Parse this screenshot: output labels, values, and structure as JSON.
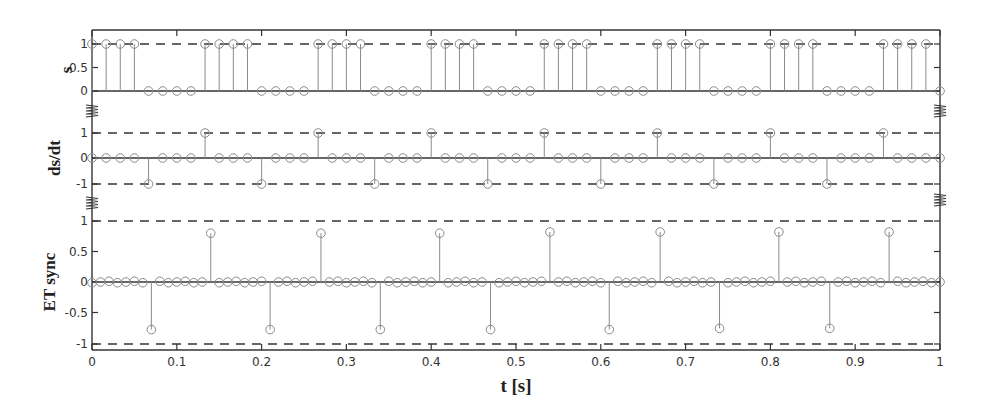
{
  "chart_data": [
    {
      "type": "stem",
      "panel": "top",
      "ylabel": "s",
      "ylim": [
        0,
        1
      ],
      "yticks": [
        "0",
        "0.5",
        "1"
      ],
      "reference_lines": [
        {
          "y": 1,
          "style": "dashed"
        },
        {
          "y": 0,
          "style": "solid"
        }
      ],
      "sample_interval": 0.016667,
      "pattern": "4 samples high (1), 4 samples low (0), period 0.1333 s",
      "x_range": [
        0,
        1
      ],
      "values_description": "square wave starting high at t=0"
    },
    {
      "type": "stem",
      "panel": "middle",
      "ylabel": "ds/dt",
      "ylim": [
        -1,
        1
      ],
      "yticks": [
        "-1",
        "0",
        "1"
      ],
      "reference_lines": [
        {
          "y": 1,
          "style": "dashed"
        },
        {
          "y": 0,
          "style": "solid"
        },
        {
          "y": -1,
          "style": "dashed"
        }
      ],
      "sample_interval": 0.016667,
      "spikes_positive_t": [
        0.133,
        0.267,
        0.4,
        0.533,
        0.667,
        0.8,
        0.933
      ],
      "spikes_negative_t": [
        0.067,
        0.2,
        0.333,
        0.467,
        0.6,
        0.733,
        0.867
      ],
      "spike_value": 1
    },
    {
      "type": "stem",
      "panel": "bottom",
      "ylabel": "ET sync",
      "ylim": [
        -1,
        1
      ],
      "yticks": [
        "-1",
        "-0.5",
        "0",
        "0.5",
        "1"
      ],
      "reference_lines": [
        {
          "y": 1,
          "style": "dashed"
        },
        {
          "y": 0,
          "style": "solid"
        },
        {
          "y": -1,
          "style": "dashed"
        }
      ],
      "sample_interval": 0.01,
      "spikes_positive_t": [
        0.14,
        0.27,
        0.41,
        0.54,
        0.67,
        0.81,
        0.94
      ],
      "spikes_positive_value": [
        0.8,
        0.8,
        0.8,
        0.82,
        0.82,
        0.82,
        0.82
      ],
      "spikes_negative_t": [
        0.07,
        0.21,
        0.34,
        0.47,
        0.61,
        0.74,
        0.87
      ],
      "spikes_negative_value": [
        -0.78,
        -0.78,
        -0.78,
        -0.78,
        -0.78,
        -0.76,
        -0.76
      ],
      "xlabel": "t [s]",
      "xticks": [
        "0",
        "0.1",
        "0.2",
        "0.3",
        "0.4",
        "0.5",
        "0.6",
        "0.7",
        "0.8",
        "0.9",
        "1"
      ],
      "xlim": [
        0,
        1
      ]
    }
  ],
  "labels": {
    "panel1_ylabel": "s",
    "panel2_ylabel": "ds/dt",
    "panel3_ylabel": "ET sync",
    "xlabel": "t [s]"
  },
  "colors": {
    "axis": "#333333",
    "stem": "#8a8a8a",
    "marker": "#8a8a8a",
    "dashed": "#333333"
  }
}
